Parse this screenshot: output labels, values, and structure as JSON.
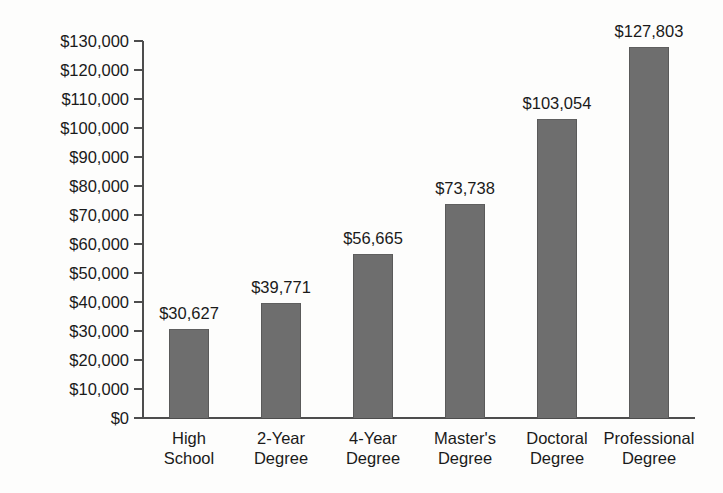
{
  "chart_data": {
    "type": "bar",
    "title": "",
    "subtitle": "",
    "xlabel": "",
    "ylabel": "",
    "categories": [
      "High School",
      "2-Year Degree",
      "4-Year Degree",
      "Master's Degree",
      "Doctoral Degree",
      "Professional Degree"
    ],
    "category_lines": [
      [
        "High",
        "School"
      ],
      [
        "2-Year",
        "Degree"
      ],
      [
        "4-Year",
        "Degree"
      ],
      [
        "Master's",
        "Degree"
      ],
      [
        "Doctoral",
        "Degree"
      ],
      [
        "Professional",
        "Degree"
      ]
    ],
    "values": [
      30627,
      39771,
      56665,
      73738,
      103054,
      127803
    ],
    "value_labels": [
      "$30,627",
      "$39,771",
      "$56,665",
      "$73,738",
      "$103,054",
      "$127,803"
    ],
    "ylim": [
      0,
      130000
    ],
    "ytick_values": [
      0,
      10000,
      20000,
      30000,
      40000,
      50000,
      60000,
      70000,
      80000,
      90000,
      100000,
      110000,
      120000,
      130000
    ],
    "ytick_labels": [
      "$0",
      "$10,000",
      "$20,000",
      "$30,000",
      "$40,000",
      "$50,000",
      "$60,000",
      "$70,000",
      "$80,000",
      "$90,000",
      "$100,000",
      "$110,000",
      "$120,000",
      "$130,000"
    ],
    "grid": false,
    "legend": false,
    "legend_position": "none",
    "series": [
      {
        "name": "",
        "values": [
          30627,
          39771,
          56665,
          73738,
          103054,
          127803
        ]
      }
    ],
    "colors": {
      "bar_fill": "#6e6e6e",
      "bar_edge": "#5a5a5a",
      "axis": "#4d4d4d",
      "text": "#1a1a1a",
      "background": "#fdfdfc"
    }
  }
}
